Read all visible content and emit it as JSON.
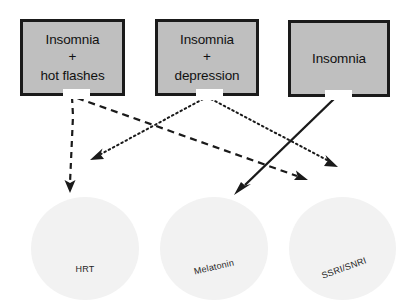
{
  "diagram": {
    "canvas": {
      "width": 410,
      "height": 306,
      "background": "#ffffff"
    },
    "palette": {
      "box_fill": "#bfbfbf",
      "box_border": "#1a1a1a",
      "circle_fill": "#f2f2f2",
      "arrow_color": "#1a1a1a",
      "text_color": "#111111",
      "label_color": "#262626"
    },
    "conditions": [
      {
        "id": "insomnia-hot-flashes",
        "lines": [
          "Insomnia",
          "+",
          "hot flashes"
        ],
        "line1": "Insomnia",
        "plus": "+",
        "line2": "hot flashes"
      },
      {
        "id": "insomnia-depression",
        "lines": [
          "Insomnia",
          "+",
          "depression"
        ],
        "line1": "Insomnia",
        "plus": "+",
        "line2": "depression"
      },
      {
        "id": "insomnia-alone",
        "lines": [
          "Insomnia"
        ],
        "line1": "Insomnia",
        "plus": "",
        "line2": ""
      }
    ],
    "therapies": [
      {
        "id": "hrt",
        "label": "HRT",
        "rotation": 0
      },
      {
        "id": "melatonin",
        "label": "Melatonin",
        "rotation": -13
      },
      {
        "id": "ssri-snri",
        "label": "SSRI/SNRI",
        "rotation": -20
      }
    ],
    "connections": [
      {
        "id": "hot-flashes-to-hrt",
        "style": "dashed",
        "from": "insomnia-hot-flashes",
        "to": "hrt",
        "path": "M 72,97 L 73,118 L 70,186",
        "arrowhead": "dashed-head"
      },
      {
        "id": "hot-flashes-to-ssri-snri",
        "style": "dashed",
        "from": "insomnia-hot-flashes",
        "to": "ssri-snri",
        "path": "M 76,97 L 300,177",
        "arrowhead": "dashed-head"
      },
      {
        "id": "depression-to-hrt",
        "style": "dotted",
        "from": "insomnia-depression",
        "to": "hrt",
        "path": "M 203,99 L 99,155",
        "arrowhead": "dotted-head"
      },
      {
        "id": "depression-to-ssri-snri",
        "style": "dotted",
        "from": "insomnia-depression",
        "to": "ssri-snri",
        "path": "M 210,99 L 331,162",
        "arrowhead": "dotted-head"
      },
      {
        "id": "insomnia-to-melatonin",
        "style": "solid",
        "from": "insomnia-alone",
        "to": "melatonin",
        "path": "M 335,98 L 242,188",
        "arrowhead": "solid-head"
      }
    ]
  }
}
